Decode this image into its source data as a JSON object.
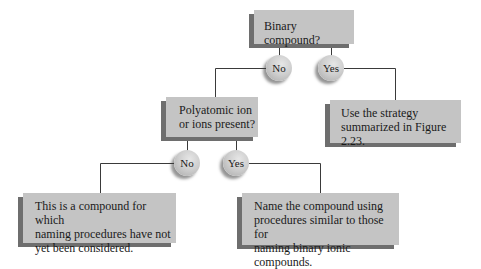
{
  "diagram": {
    "type": "decision-flowchart",
    "nodes": {
      "q1": {
        "label": "Binary compound?"
      },
      "q1_no": {
        "label": "No"
      },
      "q1_yes": {
        "label": "Yes"
      },
      "a1": {
        "label": "Use the strategy\nsummarized in Figure 2.23."
      },
      "q2": {
        "label": "Polyatomic ion\nor ions present?"
      },
      "q2_no": {
        "label": "No"
      },
      "q2_yes": {
        "label": "Yes"
      },
      "a2": {
        "label": "This is a compound for which\nnaming procedures have not\nyet been considered."
      },
      "a3": {
        "label": "Name the compound using\nprocedures similar to those for\nnaming binary ionic compounds."
      }
    },
    "edges": [
      {
        "from": "q1",
        "to": "q1_no"
      },
      {
        "from": "q1",
        "to": "q1_yes"
      },
      {
        "from": "q1_yes",
        "to": "a1"
      },
      {
        "from": "q1_no",
        "to": "q2"
      },
      {
        "from": "q2",
        "to": "q2_no"
      },
      {
        "from": "q2",
        "to": "q2_yes"
      },
      {
        "from": "q2_no",
        "to": "a2"
      },
      {
        "from": "q2_yes",
        "to": "a3"
      }
    ],
    "colors": {
      "box_fill": "#c4c4c4",
      "box_shadow": "#6e6e6e",
      "line": "#3a3a3a",
      "circle_fill": "#cfcfcf"
    }
  }
}
